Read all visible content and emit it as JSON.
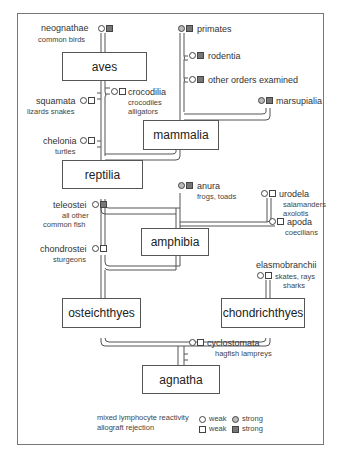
{
  "groups": {
    "aves": "aves",
    "mammalia": "mammalia",
    "reptilia": "reptilia",
    "amphibia": "amphibia",
    "osteichthyes": "osteichthyes",
    "chondrichthyes": "chondrichthyes",
    "agnatha": "agnatha"
  },
  "taxa": {
    "neognathae": {
      "name": "neognathae",
      "common": "common birds",
      "mlr": "weak",
      "graft": "strong"
    },
    "primates": {
      "name": "primates",
      "mlr": "strong",
      "graft": "strong"
    },
    "rodentia": {
      "name": "rodentia",
      "mlr": "weak",
      "graft": "strong"
    },
    "other_orders": {
      "name": "other orders examined",
      "mlr": "weak",
      "graft": "strong"
    },
    "marsupialia": {
      "name": "marsupialia",
      "mlr": "strong",
      "graft": "strong"
    },
    "squamata": {
      "name": "squamata",
      "common": "lizards snakes",
      "mlr": "weak",
      "graft": "weak"
    },
    "crocodilia": {
      "name": "crocodilia",
      "common1": "crocodiles",
      "common2": "alligators",
      "mlr": "weak",
      "graft": "weak"
    },
    "chelonia": {
      "name": "chelonia",
      "common": "turtles",
      "mlr": "weak",
      "graft": "weak"
    },
    "anura": {
      "name": "anura",
      "common": "frogs, toads",
      "mlr": "strong",
      "graft": "strong"
    },
    "urodela": {
      "name": "urodela",
      "common1": "salamanders",
      "common2": "axolotls",
      "mlr": "weak",
      "graft": "weak"
    },
    "apoda": {
      "name": "apoda",
      "common": "coecilians",
      "mlr": "weak",
      "graft": "weak"
    },
    "teleostei": {
      "name": "teleostei",
      "common1": "all other",
      "common2": "common fish",
      "mlr": "weak",
      "graft": "strong"
    },
    "chondrostei": {
      "name": "chondrostei",
      "common": "sturgeons",
      "mlr": "weak",
      "graft": "weak"
    },
    "elasmobranchii": {
      "name": "elasmobranchii",
      "common1": "skates, rays",
      "common2": "sharks",
      "mlr": "weak",
      "graft": "weak"
    },
    "cyclostomata": {
      "name": "cyclostomata",
      "common": "hagfish  lampreys",
      "mlr": "weak",
      "graft": "weak"
    }
  },
  "legend": {
    "row1_label": "mixed lymphocyte reactivity",
    "row2_label": "allograft rejection",
    "weak": "weak",
    "strong": "strong"
  },
  "colors": {
    "line": "#555555",
    "strong_square": "#777777",
    "strong_circle": "#bbbbbb"
  }
}
